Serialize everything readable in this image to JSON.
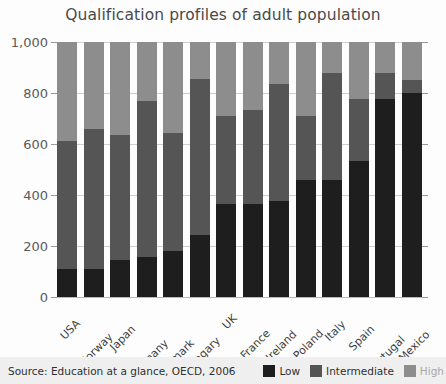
{
  "chart_data": {
    "type": "bar",
    "subtype": "stacked-column",
    "title": "Qualification profiles of adult population",
    "xlabel": "",
    "ylabel": "",
    "ylim": [
      0,
      1000
    ],
    "yticks": [
      0,
      200,
      400,
      600,
      800,
      1000
    ],
    "ytick_labels": [
      "0",
      "200",
      "400",
      "600",
      "800",
      "1,000"
    ],
    "grid": true,
    "legend_position": "bottom-right",
    "categories": [
      "USA",
      "Norway",
      "Japan",
      "Germany",
      "Denmark",
      "Hungary",
      "UK",
      "France",
      "Ireland",
      "Poland",
      "Italy",
      "Spain",
      "Portugal",
      "Mexico"
    ],
    "series": [
      {
        "name": "Low",
        "color": "#1e1e1e",
        "values": [
          110,
          110,
          145,
          155,
          180,
          245,
          365,
          365,
          375,
          460,
          460,
          535,
          775,
          800
        ]
      },
      {
        "name": "Intermediate",
        "color": "#555555",
        "values": [
          500,
          550,
          490,
          615,
          465,
          610,
          345,
          370,
          460,
          250,
          420,
          240,
          105,
          50
        ]
      },
      {
        "name": "High",
        "color": "#8d8d8d",
        "values": [
          390,
          340,
          365,
          230,
          355,
          145,
          290,
          265,
          165,
          290,
          120,
          225,
          120,
          150
        ]
      }
    ],
    "segment_tops": {
      "low": [
        110,
        110,
        145,
        155,
        180,
        245,
        365,
        365,
        375,
        460,
        460,
        535,
        775,
        800
      ],
      "intermediate": [
        610,
        660,
        635,
        770,
        645,
        855,
        710,
        735,
        835,
        710,
        880,
        775,
        880,
        850
      ],
      "high": [
        1000,
        1000,
        1000,
        1000,
        1000,
        1000,
        1000,
        1000,
        1000,
        1000,
        1000,
        1000,
        1000,
        1000
      ]
    },
    "annotations": {
      "source": "Source: Education at a glance, OECD, 2006"
    }
  },
  "footer": {
    "source": "Source: Education at a glance, OECD, 2006",
    "legend": [
      {
        "label": "Low",
        "color": "#1e1e1e",
        "muted": false
      },
      {
        "label": "Intermediate",
        "color": "#555555",
        "muted": false
      },
      {
        "label": "High",
        "color": "#8d8d8d",
        "muted": true
      }
    ]
  }
}
